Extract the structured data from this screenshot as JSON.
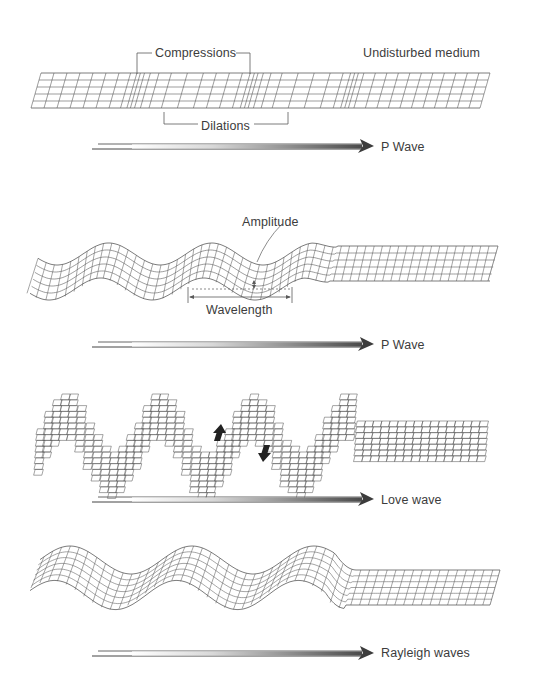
{
  "figure": {
    "background": "#ffffff",
    "line_color": "#5a5a5a",
    "panels": [
      {
        "id": "p-wave-compressions",
        "wave_type": "P Wave",
        "labels": {
          "compressions": "Compressions",
          "undisturbed": "Undisturbed medium",
          "dilations": "Dilations"
        },
        "arrow_label": "P Wave"
      },
      {
        "id": "s-wave-amplitude",
        "wave_type": "P Wave",
        "labels": {
          "amplitude": "Amplitude",
          "wavelength": "Wavelength"
        },
        "arrow_label": "P Wave"
      },
      {
        "id": "love-wave",
        "wave_type": "Love wave",
        "arrow_label": "Love wave"
      },
      {
        "id": "rayleigh-wave",
        "wave_type": "Rayleigh waves",
        "arrow_label": "Rayleigh waves"
      }
    ]
  }
}
